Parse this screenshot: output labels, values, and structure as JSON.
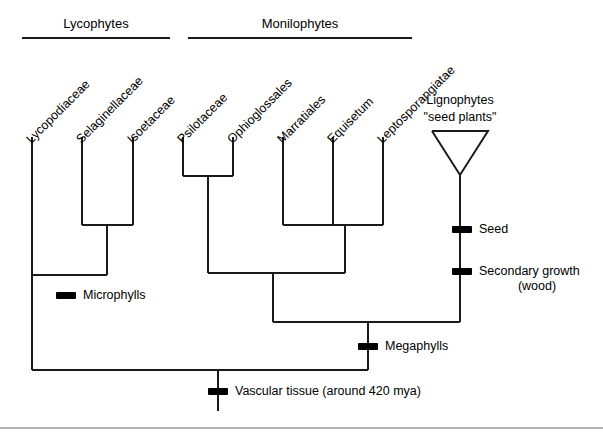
{
  "figure": {
    "line_color": "#1a1a1a",
    "text_color": "#000000",
    "background": "#ffffff",
    "footer_rule_color": "#b3b3b3"
  },
  "clades": [
    {
      "id": "lycophytes",
      "label": "Lycophytes"
    },
    {
      "id": "monilophytes",
      "label": "Monilophytes"
    }
  ],
  "tips": [
    {
      "id": "lycopodiaceae",
      "label": "Lycopodiaceae"
    },
    {
      "id": "selaginellaceae",
      "label": "Selaginellaceae"
    },
    {
      "id": "isoetaceae",
      "label": "Isoetaceae"
    },
    {
      "id": "psilotaceae",
      "label": "Psilotaceae"
    },
    {
      "id": "ophioglossales",
      "label": "Ophioglossales"
    },
    {
      "id": "marratiales",
      "label": "Marratiales"
    },
    {
      "id": "equisetum",
      "label": "Equisetum"
    },
    {
      "id": "leptosporangiatae",
      "label": "Leptosporangiatae"
    }
  ],
  "triangle_clade": {
    "id": "lignophytes",
    "label_line1": "Lignophytes",
    "label_line2": "\"seed plants\""
  },
  "traits": [
    {
      "id": "seed",
      "label": "Seed"
    },
    {
      "id": "secondary-growth",
      "label": "Secondary growth",
      "sublabel": "(wood)"
    },
    {
      "id": "microphylls",
      "label": "Microphylls"
    },
    {
      "id": "megaphylls",
      "label": "Megaphylls"
    },
    {
      "id": "vascular-tissue",
      "label": "Vascular tissue (around 420 mya)"
    }
  ]
}
